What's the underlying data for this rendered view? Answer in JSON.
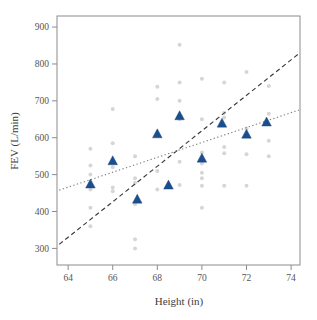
{
  "chart_data": {
    "type": "scatter",
    "title": "",
    "xlabel": "Height (in)",
    "ylabel": "FEV (L/min)",
    "xlim": [
      63.5,
      74.4
    ],
    "ylim": [
      255,
      930
    ],
    "xticks": [
      64,
      66,
      68,
      70,
      72,
      74
    ],
    "xtick_labels": [
      "64",
      "66",
      "68",
      "70",
      "72",
      "74"
    ],
    "yticks": [
      300,
      400,
      500,
      600,
      700,
      800,
      900
    ],
    "ytick_labels": [
      "300",
      "400",
      "500",
      "600",
      "700",
      "800",
      "900"
    ],
    "grid": false,
    "legend": "none",
    "series": [
      {
        "name": "Individual observations",
        "marker": "circle",
        "color": "#d6d6d6",
        "points": [
          [
            65,
            570
          ],
          [
            65,
            525
          ],
          [
            65,
            500
          ],
          [
            65,
            460
          ],
          [
            65,
            410
          ],
          [
            65,
            360
          ],
          [
            66,
            678
          ],
          [
            66,
            585
          ],
          [
            66,
            520
          ],
          [
            66,
            465
          ],
          [
            66,
            455
          ],
          [
            67,
            550
          ],
          [
            67,
            490
          ],
          [
            67,
            478
          ],
          [
            67,
            420
          ],
          [
            67,
            325
          ],
          [
            67,
            300
          ],
          [
            68,
            738
          ],
          [
            68,
            705
          ],
          [
            68,
            605
          ],
          [
            68,
            510
          ],
          [
            68,
            460
          ],
          [
            69,
            852
          ],
          [
            69,
            750
          ],
          [
            69,
            700
          ],
          [
            69,
            650
          ],
          [
            69,
            535
          ],
          [
            69,
            472
          ],
          [
            70,
            760
          ],
          [
            70,
            650
          ],
          [
            70,
            560
          ],
          [
            70,
            530
          ],
          [
            70,
            505
          ],
          [
            70,
            490
          ],
          [
            70,
            470
          ],
          [
            70,
            410
          ],
          [
            71,
            750
          ],
          [
            71,
            668
          ],
          [
            71,
            655
          ],
          [
            71,
            575
          ],
          [
            71,
            558
          ],
          [
            71,
            470
          ],
          [
            72,
            778
          ],
          [
            72,
            625
          ],
          [
            72,
            555
          ],
          [
            72,
            470
          ],
          [
            73,
            740
          ],
          [
            73,
            665
          ],
          [
            73,
            592
          ],
          [
            73,
            550
          ]
        ]
      },
      {
        "name": "Group means",
        "marker": "triangle",
        "color": "#1a4f8f",
        "points": [
          [
            65.0,
            473
          ],
          [
            66.0,
            536
          ],
          [
            67.1,
            432
          ],
          [
            68.0,
            609
          ],
          [
            68.5,
            470
          ],
          [
            69.0,
            658
          ],
          [
            70.0,
            543
          ],
          [
            70.9,
            638
          ],
          [
            72.0,
            608
          ],
          [
            72.9,
            641
          ]
        ]
      }
    ],
    "fit_lines": [
      {
        "name": "dashed-fit-line",
        "style": "dashed",
        "color": "#3a3a3a",
        "x": [
          63.6,
          74.35
        ],
        "y": [
          311,
          828
        ]
      },
      {
        "name": "dotted-fit-line",
        "style": "dotted",
        "color": "#7d7d7d",
        "x": [
          63.6,
          74.35
        ],
        "y": [
          458,
          675
        ]
      }
    ]
  }
}
